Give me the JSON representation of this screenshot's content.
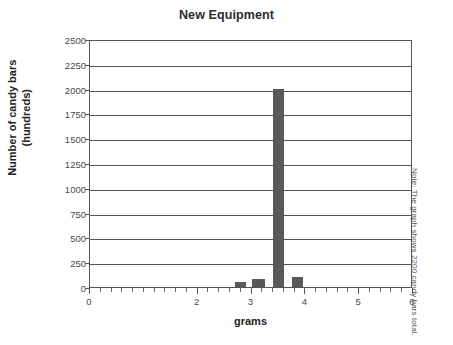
{
  "chart_data": {
    "type": "bar",
    "title": "New Equipment",
    "xlabel": "grams",
    "ylabel": "Number of candy bars (hundreds)",
    "ylabel_line1": "Number of candy bars",
    "ylabel_line2": "(hundreds)",
    "xlim": [
      0,
      6
    ],
    "ylim": [
      0,
      2500
    ],
    "grid": true,
    "legend": null,
    "annotation": "Note: The graph shows 2200 candy bars total.",
    "y_ticks": [
      0,
      250,
      500,
      750,
      1000,
      1250,
      1500,
      1750,
      2000,
      2250,
      2500
    ],
    "y_ticklabels": [
      "0",
      "250",
      "500",
      "750",
      "1000",
      "1250",
      "1500",
      "1750",
      "2000",
      "2250",
      "2500"
    ],
    "x_ticks": [
      0,
      2,
      3,
      4,
      5,
      6
    ],
    "x_ticklabels": [
      "0",
      "2",
      "3",
      "4",
      "5",
      "6"
    ],
    "x_minor_tick_step": 0.2,
    "bar_color": "#595959",
    "bars": [
      {
        "x_start": 2.7,
        "x_end": 2.9,
        "center": 2.8,
        "value": 50
      },
      {
        "x_start": 3.0,
        "x_end": 3.25,
        "center": 3.125,
        "value": 80
      },
      {
        "x_start": 3.4,
        "x_end": 3.6,
        "center": 3.5,
        "value": 2000
      },
      {
        "x_start": 3.75,
        "x_end": 3.95,
        "center": 3.85,
        "value": 100
      }
    ],
    "categories": [
      "2.8",
      "3.125",
      "3.5",
      "3.85"
    ],
    "values": [
      50,
      80,
      2000,
      100
    ]
  }
}
